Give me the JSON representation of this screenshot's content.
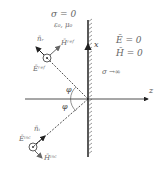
{
  "diagram": {
    "type": "plane-wave reflection at perfect conductor",
    "left_medium": {
      "sigma": "σ = 0",
      "params": "ε₀, μ₀"
    },
    "right_medium": {
      "E": "Ē = 0",
      "H": "H̄ = 0",
      "sigma": "σ →∞"
    },
    "axes": {
      "x_label": "x",
      "z_label": "z"
    },
    "angles": {
      "reflected": "φ",
      "incident": "φ"
    },
    "reflected_wave": {
      "direction": "n̄ᵣ",
      "E": "Ēʳᵉᶠ",
      "H": "H̄ʳᵉᶠ"
    },
    "incident_wave": {
      "direction": "n̄ᵢ",
      "E": "Ēⁱⁿᶜ",
      "H": "H̄ⁱⁿᶜ"
    },
    "colors": {
      "line": "#222222",
      "label": "#666666"
    }
  }
}
